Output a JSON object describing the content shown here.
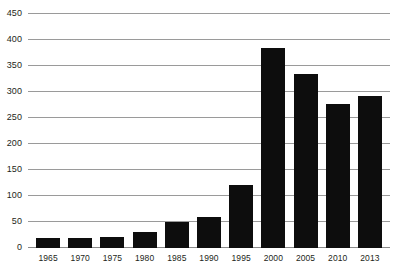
{
  "chart_data": {
    "type": "bar",
    "title": "",
    "subtitle": "",
    "xlabel": "",
    "ylabel": "",
    "categories": [
      "1965",
      "1970",
      "1975",
      "1980",
      "1985",
      "1990",
      "1995",
      "2000",
      "2005",
      "2010",
      "2013"
    ],
    "values": [
      20,
      20,
      22,
      30,
      50,
      60,
      122,
      385,
      335,
      277,
      292
    ],
    "series": [
      {
        "name": "",
        "values": [
          20,
          20,
          22,
          30,
          50,
          60,
          122,
          385,
          335,
          277,
          292
        ]
      }
    ],
    "ylim": [
      0,
      450
    ],
    "yticks": [
      0,
      50,
      100,
      150,
      200,
      250,
      300,
      350,
      400,
      450
    ],
    "ytick_labels": [
      "0",
      "50",
      "100",
      "150",
      "200",
      "250",
      "300",
      "350",
      "400",
      "450"
    ],
    "grid": true,
    "legend": false,
    "legend_position": "none",
    "bar_color": "#0d0d0d",
    "gridline_color": "#9a9a9a",
    "background_color": "#ffffff",
    "text_color": "#231f20"
  }
}
